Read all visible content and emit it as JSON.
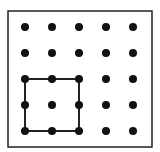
{
  "diagram": {
    "type": "geoboard",
    "grid": {
      "rows": 5,
      "cols": 5,
      "xs": [
        25,
        52,
        79,
        106,
        133
      ],
      "ys": [
        27,
        53,
        79,
        105,
        131
      ],
      "dot_radius": 4,
      "dot_color": "#111111"
    },
    "frame": {
      "x": 8,
      "y": 11,
      "width": 144,
      "height": 136,
      "stroke": "#222222"
    },
    "shapes": [
      {
        "name": "square",
        "vertices": [
          [
            0,
            2
          ],
          [
            2,
            2
          ],
          [
            2,
            4
          ],
          [
            0,
            4
          ]
        ],
        "stroke": "#222222"
      }
    ]
  }
}
